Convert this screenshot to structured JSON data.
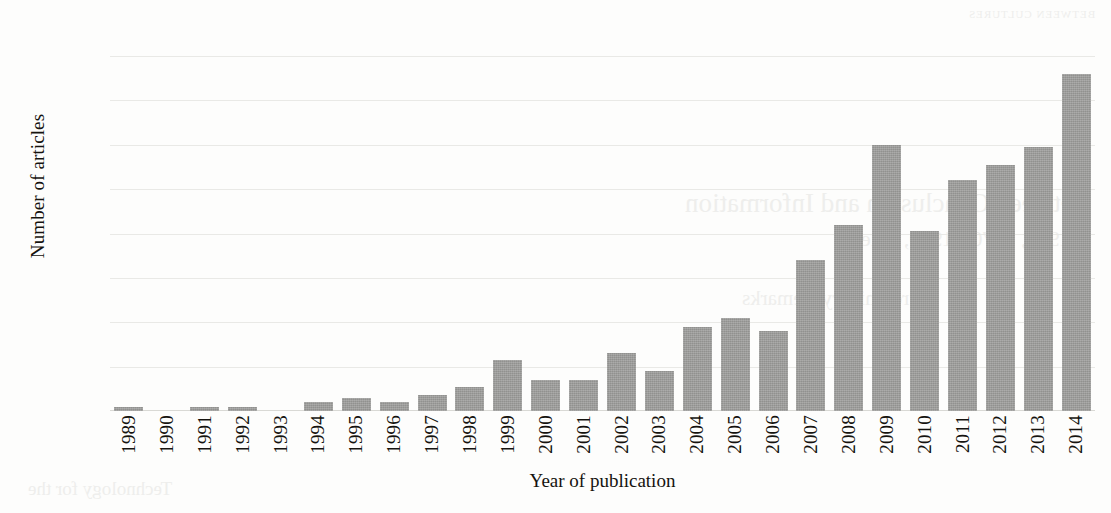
{
  "chart_data": {
    "type": "bar",
    "title": "",
    "xlabel": "Year of publication",
    "ylabel": "Number of articles",
    "categories": [
      "1989",
      "1990",
      "1991",
      "1992",
      "1993",
      "1994",
      "1995",
      "1996",
      "1997",
      "1998",
      "1999",
      "2000",
      "2001",
      "2002",
      "2003",
      "2004",
      "2005",
      "2006",
      "2007",
      "2008",
      "2009",
      "2010",
      "2011",
      "2012",
      "2013",
      "2014"
    ],
    "values": [
      1,
      0,
      1,
      1,
      0,
      2,
      3,
      2,
      3.5,
      5.5,
      11.5,
      7,
      7,
      13,
      9,
      19,
      21,
      18,
      34,
      42,
      60,
      40.5,
      52,
      55.5,
      59.5,
      76
    ],
    "ylim": [
      0,
      80
    ],
    "yticks": [
      0,
      10,
      20,
      30,
      40,
      50,
      60,
      70,
      80
    ],
    "ytick_labels": [
      "0",
      "10",
      "20",
      "30",
      "40",
      "50",
      "60",
      "70",
      "80"
    ],
    "grid": true,
    "grid_axis": "y",
    "legend": null,
    "legend_position": "none",
    "bar_color": "#9b9b99",
    "grid_color": "#e9e9e6",
    "text_color": "#15130f",
    "background_color": "#fdfdfc"
  },
  "bleed_through": {
    "lines": [
      "BETWEEN CULTURES",
      "Between Conclusion and Information",
      "1958, 1970 - 1990, et le",
      "Preliminary Remarks",
      "Technology for the"
    ]
  }
}
